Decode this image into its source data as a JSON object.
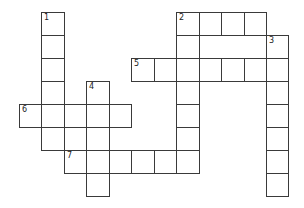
{
  "puzzle": {
    "type": "crossword",
    "grid": {
      "origin_x": 19,
      "origin_y": 12,
      "cell_w": 22.45,
      "cell_h": 23,
      "line_color": "#3a3a3a",
      "fill_color": "#ffffff"
    },
    "entries": [
      {
        "number": "1",
        "direction": "down",
        "row": 0,
        "col": 1,
        "length": 6
      },
      {
        "number": "2",
        "direction": "across",
        "row": 0,
        "col": 7,
        "length": 4
      },
      {
        "number": "2",
        "direction": "down",
        "row": 0,
        "col": 7,
        "length": 7
      },
      {
        "number": "3",
        "direction": "down",
        "row": 1,
        "col": 11,
        "length": 7
      },
      {
        "number": "4",
        "direction": "down",
        "row": 3,
        "col": 3,
        "length": 5
      },
      {
        "number": "5",
        "direction": "across",
        "row": 2,
        "col": 5,
        "length": 7
      },
      {
        "number": "6",
        "direction": "across",
        "row": 4,
        "col": 0,
        "length": 5
      },
      {
        "number": "7",
        "direction": "across",
        "row": 6,
        "col": 2,
        "length": 6
      }
    ]
  }
}
